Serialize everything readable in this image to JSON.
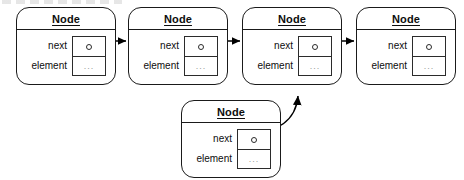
{
  "diagram": {
    "node_label": "Node",
    "field_next_label": "next",
    "field_element_label": "element",
    "element_value": "...",
    "pointer_glyph": "circle-pointer",
    "colors": {
      "stroke": "#1a1a1a",
      "box_stroke": "#2b2b2b",
      "background": "#ffffff",
      "ellipsis": "#9a9a9a",
      "arrow": "#000000"
    },
    "nodes": [
      {
        "id": "node-1",
        "label": "Node",
        "next": "...",
        "element": "...",
        "x": 16,
        "y": 7,
        "role": "head"
      },
      {
        "id": "node-2",
        "label": "Node",
        "next": "...",
        "element": "...",
        "x": 128,
        "y": 7,
        "role": "middle"
      },
      {
        "id": "node-3",
        "label": "Node",
        "next": "...",
        "element": "...",
        "x": 242,
        "y": 7,
        "role": "middle"
      },
      {
        "id": "node-4",
        "label": "Node",
        "next": "...",
        "element": "...",
        "x": 356,
        "y": 7,
        "role": "tail"
      },
      {
        "id": "node-5",
        "label": "Node",
        "next": "...",
        "element": "...",
        "x": 181,
        "y": 100,
        "role": "inserted"
      }
    ],
    "arrows": [
      {
        "id": "arrow-1-to-2",
        "from": "node-1.next",
        "to": "node-2",
        "kind": "straight"
      },
      {
        "id": "arrow-2-to-3",
        "from": "node-2.next",
        "to": "node-3",
        "kind": "straight"
      },
      {
        "id": "arrow-3-to-4",
        "from": "node-3.next",
        "to": "node-4",
        "kind": "straight"
      },
      {
        "id": "arrow-5-to-3",
        "from": "node-5.next",
        "to": "node-3",
        "kind": "curved"
      }
    ]
  }
}
